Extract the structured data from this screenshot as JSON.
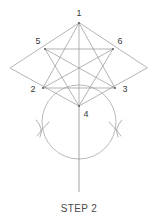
{
  "figure": {
    "title_caption": "STEP 2",
    "stroke_color": "#949494",
    "label_color": "#3a3a3a",
    "background_color": "#ffffff",
    "vertices": [
      {
        "id": "1",
        "label": "1",
        "x": 79,
        "y": 23,
        "label_x": 79,
        "label_y": 16,
        "label_anchor": "middle"
      },
      {
        "id": "5",
        "label": "5",
        "x": 45,
        "y": 49,
        "label_x": 38,
        "label_y": 44,
        "label_anchor": "middle"
      },
      {
        "id": "6",
        "label": "6",
        "x": 113,
        "y": 49,
        "label_x": 120,
        "label_y": 44,
        "label_anchor": "middle"
      },
      {
        "id": "2",
        "label": "2",
        "x": 43,
        "y": 88,
        "label_x": 33,
        "label_y": 92,
        "label_anchor": "middle"
      },
      {
        "id": "3",
        "label": "3",
        "x": 115,
        "y": 88,
        "label_x": 125,
        "label_y": 92,
        "label_anchor": "middle"
      },
      {
        "id": "4",
        "label": "4",
        "x": 79,
        "y": 106,
        "label_x": 86,
        "label_y": 116,
        "label_anchor": "middle"
      }
    ],
    "rhombus": {
      "left_x": 10,
      "left_y": 68,
      "right_x": 147,
      "right_y": 68,
      "top_x": 79,
      "top_y": 23,
      "bottom_x": 79,
      "bottom_y": 106
    },
    "circle": {
      "cx": 79,
      "cy": 122,
      "r": 37
    },
    "vertical_line": {
      "x": 79,
      "y1": 106,
      "y2": 192
    },
    "arc_marks": [
      {
        "side": "left",
        "cx": 43,
        "cy": 128
      },
      {
        "side": "right",
        "cx": 115,
        "cy": 128
      }
    ],
    "connections": [
      "1-2",
      "1-3",
      "1-4",
      "2-3",
      "2-6",
      "3-5",
      "4-5",
      "4-6",
      "5-6",
      "rhombus-left-top",
      "rhombus-left-bottom",
      "rhombus-right-top",
      "rhombus-right-bottom"
    ]
  }
}
